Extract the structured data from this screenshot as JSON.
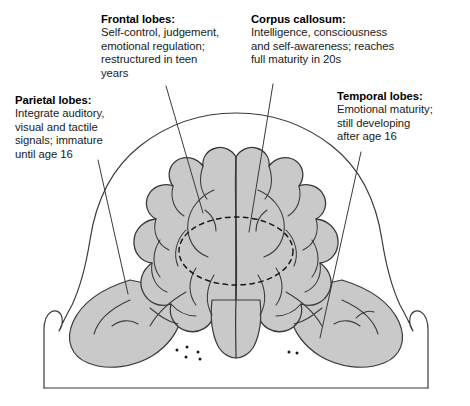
{
  "figure": {
    "name": "teen-brain-annotated-diagram",
    "view": "posterior view of human brain within head outline",
    "colors": {
      "brain_fill": "#c9c9c9",
      "outline": "#3a3a3a",
      "text": "#1a1a1a",
      "background": "#ffffff"
    }
  },
  "callouts": [
    {
      "id": "frontal",
      "title": "Frontal lobes:",
      "body": "Self-control, judgement,\nemotional regulation;\nrestructured in teen\nyears"
    },
    {
      "id": "corpus",
      "title": "Corpus callosum:",
      "body": "Intelligence, consciousness\nand self-awareness; reaches\nfull maturity in 20s"
    },
    {
      "id": "parietal",
      "title": "Parietal lobes:",
      "body": "Integrate auditory,\nvisual and tactile\nsignals; immature\nuntil age 16"
    },
    {
      "id": "temporal",
      "title": "Temporal lobes:",
      "body": "Emotional maturity;\nstill developing\nafter age 16"
    }
  ],
  "leader_lines": [
    {
      "id": "frontal",
      "from_x": 166,
      "from_y": 86,
      "to_x": 203,
      "to_y": 213
    },
    {
      "id": "corpus",
      "from_x": 273,
      "from_y": 84,
      "to_x": 249,
      "to_y": 232
    },
    {
      "id": "parietal",
      "from_x": 98,
      "from_y": 160,
      "to_x": 128,
      "to_y": 294
    },
    {
      "id": "temporal",
      "from_x": 361,
      "from_y": 152,
      "to_x": 320,
      "to_y": 338
    }
  ],
  "annotations": {
    "corpus_callosum_marker": "dashed ellipse at brain center",
    "cerebellum_dots_left": 5,
    "cerebellum_dots_right": 2
  }
}
